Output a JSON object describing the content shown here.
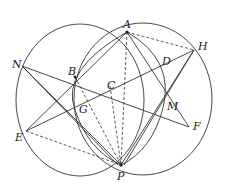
{
  "diagram": {
    "points": {
      "A": {
        "label": "A",
        "x": 127,
        "y": 32
      },
      "H": {
        "label": "H",
        "x": 194,
        "y": 50
      },
      "D": {
        "label": "D",
        "x": 161,
        "y": 68
      },
      "N": {
        "label": "N",
        "x": 22,
        "y": 66
      },
      "B": {
        "label": "B",
        "x": 75,
        "y": 77
      },
      "C": {
        "label": "C",
        "x": 110,
        "y": 86
      },
      "G": {
        "label": "G",
        "x": 75,
        "y": 110
      },
      "M": {
        "label": "M",
        "x": 163,
        "y": 108
      },
      "F": {
        "label": "F",
        "x": 189,
        "y": 127
      },
      "E": {
        "label": "E",
        "x": 26,
        "y": 131
      },
      "P": {
        "label": "P",
        "x": 121,
        "y": 165
      }
    },
    "circles": [
      {
        "name": "left-circle",
        "through": [
          "A",
          "N",
          "E",
          "P"
        ]
      },
      {
        "name": "right-circle",
        "through": [
          "A",
          "H",
          "F",
          "P"
        ]
      },
      {
        "name": "inner-circle",
        "through": [
          "A",
          "B",
          "G",
          "P",
          "D",
          "M"
        ]
      }
    ],
    "solid_segments": [
      [
        "N",
        "F"
      ],
      [
        "E",
        "H"
      ],
      [
        "N",
        "P"
      ],
      [
        "N",
        "M"
      ],
      [
        "E",
        "D"
      ],
      [
        "H",
        "P"
      ],
      [
        "F",
        "A"
      ],
      [
        "A",
        "P"
      ],
      [
        "H",
        "G"
      ],
      [
        "B",
        "P"
      ]
    ],
    "dashed_segments": [
      [
        "A",
        "H"
      ],
      [
        "E",
        "P"
      ],
      [
        "A",
        "P"
      ],
      [
        "C",
        "P"
      ],
      [
        "B",
        "P"
      ]
    ]
  }
}
